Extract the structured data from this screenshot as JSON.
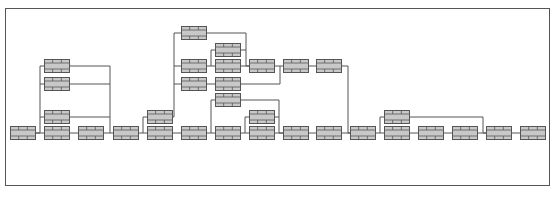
{
  "diagram": {
    "type": "network-diagram",
    "node_style": {
      "width": 26,
      "height": 14,
      "fill": "#c8c8c8",
      "stroke": "#555555",
      "line_color": "#555555"
    },
    "nodes": [
      {
        "id": "n1",
        "x": 10,
        "y": 126
      },
      {
        "id": "n2",
        "x": 44,
        "y": 59
      },
      {
        "id": "n3",
        "x": 44,
        "y": 77
      },
      {
        "id": "n4",
        "x": 44,
        "y": 110
      },
      {
        "id": "n5",
        "x": 44,
        "y": 126
      },
      {
        "id": "n6",
        "x": 78,
        "y": 126
      },
      {
        "id": "n7",
        "x": 113,
        "y": 126
      },
      {
        "id": "n8",
        "x": 147,
        "y": 110
      },
      {
        "id": "n9",
        "x": 147,
        "y": 126
      },
      {
        "id": "n10",
        "x": 181,
        "y": 26
      },
      {
        "id": "n11",
        "x": 181,
        "y": 59
      },
      {
        "id": "n12",
        "x": 181,
        "y": 77
      },
      {
        "id": "n13",
        "x": 181,
        "y": 126
      },
      {
        "id": "n14",
        "x": 215,
        "y": 43
      },
      {
        "id": "n15",
        "x": 215,
        "y": 59
      },
      {
        "id": "n16",
        "x": 215,
        "y": 77
      },
      {
        "id": "n17",
        "x": 215,
        "y": 93
      },
      {
        "id": "n18",
        "x": 215,
        "y": 126
      },
      {
        "id": "n19",
        "x": 249,
        "y": 59
      },
      {
        "id": "n20",
        "x": 249,
        "y": 110
      },
      {
        "id": "n21",
        "x": 249,
        "y": 126
      },
      {
        "id": "n22",
        "x": 283,
        "y": 59
      },
      {
        "id": "n23",
        "x": 283,
        "y": 126
      },
      {
        "id": "n24",
        "x": 316,
        "y": 59
      },
      {
        "id": "n25",
        "x": 316,
        "y": 126
      },
      {
        "id": "n26",
        "x": 350,
        "y": 126
      },
      {
        "id": "n27",
        "x": 384,
        "y": 110
      },
      {
        "id": "n28",
        "x": 384,
        "y": 126
      },
      {
        "id": "n29",
        "x": 418,
        "y": 126
      },
      {
        "id": "n30",
        "x": 452,
        "y": 126
      },
      {
        "id": "n31",
        "x": 486,
        "y": 126
      },
      {
        "id": "n32",
        "x": 520,
        "y": 126
      }
    ],
    "edges": [
      [
        [
          36,
          133
        ],
        [
          44,
          133
        ]
      ],
      [
        [
          36,
          133
        ],
        [
          40,
          133
        ],
        [
          40,
          66
        ],
        [
          44,
          66
        ]
      ],
      [
        [
          40,
          84
        ],
        [
          44,
          84
        ]
      ],
      [
        [
          40,
          117
        ],
        [
          44,
          117
        ]
      ],
      [
        [
          70,
          66
        ],
        [
          110,
          66
        ],
        [
          110,
          133
        ]
      ],
      [
        [
          70,
          84
        ],
        [
          110,
          84
        ]
      ],
      [
        [
          70,
          117
        ],
        [
          110,
          117
        ]
      ],
      [
        [
          70,
          133
        ],
        [
          78,
          133
        ]
      ],
      [
        [
          104,
          133
        ],
        [
          113,
          133
        ]
      ],
      [
        [
          139,
          133
        ],
        [
          147,
          133
        ]
      ],
      [
        [
          143,
          133
        ],
        [
          143,
          117
        ],
        [
          147,
          117
        ]
      ],
      [
        [
          173,
          117
        ],
        [
          174,
          117
        ],
        [
          174,
          33
        ],
        [
          181,
          33
        ]
      ],
      [
        [
          174,
          66
        ],
        [
          181,
          66
        ]
      ],
      [
        [
          174,
          84
        ],
        [
          181,
          84
        ]
      ],
      [
        [
          173,
          133
        ],
        [
          181,
          133
        ]
      ],
      [
        [
          207,
          33
        ],
        [
          246,
          33
        ],
        [
          246,
          66
        ],
        [
          249,
          66
        ]
      ],
      [
        [
          207,
          66
        ],
        [
          215,
          66
        ]
      ],
      [
        [
          211,
          66
        ],
        [
          211,
          50
        ],
        [
          215,
          50
        ]
      ],
      [
        [
          241,
          50
        ],
        [
          246,
          50
        ]
      ],
      [
        [
          241,
          66
        ],
        [
          249,
          66
        ]
      ],
      [
        [
          207,
          84
        ],
        [
          215,
          84
        ]
      ],
      [
        [
          241,
          84
        ],
        [
          280,
          84
        ],
        [
          280,
          66
        ]
      ],
      [
        [
          207,
          133
        ],
        [
          215,
          133
        ]
      ],
      [
        [
          211,
          133
        ],
        [
          211,
          100
        ],
        [
          215,
          100
        ]
      ],
      [
        [
          241,
          100
        ],
        [
          279,
          100
        ],
        [
          279,
          133
        ],
        [
          283,
          133
        ]
      ],
      [
        [
          241,
          133
        ],
        [
          249,
          133
        ]
      ],
      [
        [
          245,
          133
        ],
        [
          245,
          117
        ],
        [
          249,
          117
        ]
      ],
      [
        [
          275,
          117
        ],
        [
          279,
          117
        ]
      ],
      [
        [
          275,
          133
        ],
        [
          283,
          133
        ]
      ],
      [
        [
          275,
          66
        ],
        [
          283,
          66
        ]
      ],
      [
        [
          309,
          66
        ],
        [
          316,
          66
        ]
      ],
      [
        [
          342,
          66
        ],
        [
          348,
          66
        ],
        [
          348,
          133
        ],
        [
          350,
          133
        ]
      ],
      [
        [
          309,
          133
        ],
        [
          316,
          133
        ]
      ],
      [
        [
          342,
          133
        ],
        [
          350,
          133
        ]
      ],
      [
        [
          376,
          133
        ],
        [
          384,
          133
        ]
      ],
      [
        [
          380,
          133
        ],
        [
          380,
          117
        ],
        [
          384,
          117
        ]
      ],
      [
        [
          410,
          117
        ],
        [
          483,
          117
        ],
        [
          483,
          133
        ],
        [
          486,
          133
        ]
      ],
      [
        [
          410,
          133
        ],
        [
          418,
          133
        ]
      ],
      [
        [
          444,
          133
        ],
        [
          452,
          133
        ]
      ],
      [
        [
          478,
          133
        ],
        [
          486,
          133
        ]
      ],
      [
        [
          512,
          133
        ],
        [
          520,
          133
        ]
      ]
    ]
  },
  "caption": ""
}
